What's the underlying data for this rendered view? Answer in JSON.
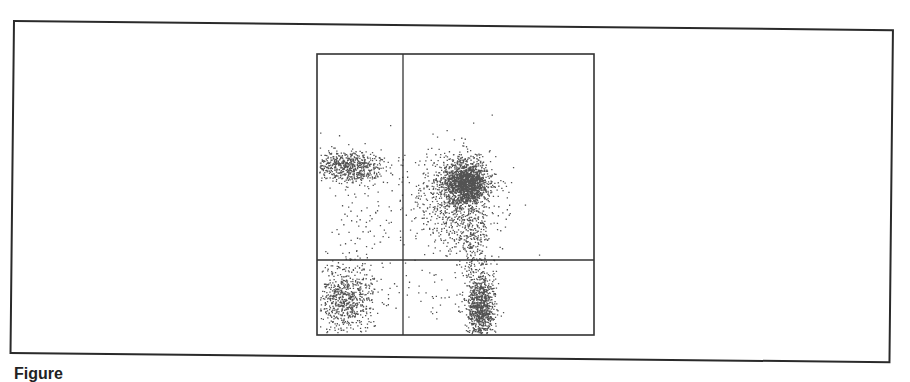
{
  "figure": {
    "caption": "Figure"
  },
  "chart_data": {
    "type": "scatter",
    "title": "",
    "xlabel": "",
    "ylabel": "",
    "grid": false,
    "legend": null,
    "quadrant_gates": {
      "x_divider_fraction": 0.31,
      "y_divider_fraction": 0.73
    },
    "plot_box_px": {
      "left": 317,
      "top": 54,
      "right": 594,
      "bottom": 335
    },
    "gate_lines_px": {
      "vertical_x": 403,
      "horizontal_y": 260
    },
    "clusters": [
      {
        "name": "upper-left population",
        "quadrant": "Q1-upper-left",
        "cx": 348,
        "cy": 166,
        "sx": 18,
        "sy": 8,
        "n": 650,
        "tail": false
      },
      {
        "name": "upper-left sparse tail",
        "quadrant": "Q1-upper-left",
        "cx": 360,
        "cy": 215,
        "sx": 22,
        "sy": 30,
        "n": 90,
        "tail": true
      },
      {
        "name": "double-positive dense population",
        "quadrant": "Q2-upper-right",
        "cx": 466,
        "cy": 183,
        "sx": 11,
        "sy": 11,
        "n": 1500,
        "tail": false
      },
      {
        "name": "upper-right spread",
        "quadrant": "Q2-upper-right",
        "cx": 452,
        "cy": 200,
        "sx": 24,
        "sy": 25,
        "n": 700,
        "tail": true
      },
      {
        "name": "upper-right downward tail",
        "quadrant": "Q2-upper-right",
        "cx": 472,
        "cy": 235,
        "sx": 9,
        "sy": 16,
        "n": 220,
        "tail": true
      },
      {
        "name": "lower-left population",
        "quadrant": "Q3-lower-left",
        "cx": 345,
        "cy": 298,
        "sx": 14,
        "sy": 17,
        "n": 700,
        "tail": false
      },
      {
        "name": "lower-right population",
        "quadrant": "Q4-lower-right",
        "cx": 480,
        "cy": 306,
        "sx": 7,
        "sy": 17,
        "n": 900,
        "tail": false
      },
      {
        "name": "lower-right sparse",
        "quadrant": "Q4-lower-right",
        "cx": 440,
        "cy": 290,
        "sx": 30,
        "sy": 20,
        "n": 60,
        "tail": true
      }
    ],
    "colors": {
      "points": "#1a1a1a",
      "axes": "#333333",
      "background": "#ffffff"
    }
  }
}
